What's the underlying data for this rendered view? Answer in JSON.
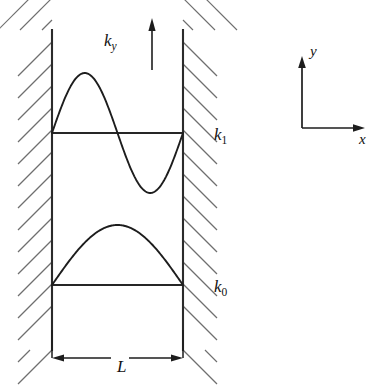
{
  "figure": {
    "background_color": "#ffffff",
    "ink_color": "#1d1d1d",
    "hatch_color": "#6f6f6f",
    "width": 391,
    "height": 385
  },
  "well": {
    "left_wall_x": 52,
    "right_wall_x": 183,
    "wall_top_y": 30,
    "wall_bottom_y": 350,
    "hatch_count": 15,
    "hatch_spacing": 22,
    "hatch_length": 34,
    "hatch_angle_deg": 45
  },
  "levels": [
    {
      "name": "k1",
      "label_base": "k",
      "label_sub": "1",
      "baseline_y": 133,
      "label_x": 214,
      "label_y": 140,
      "mode_number": 2,
      "amplitude": 60,
      "description": "full sine, one node at center"
    },
    {
      "name": "k0",
      "label_base": "k",
      "label_sub": "0",
      "baseline_y": 285,
      "label_x": 214,
      "label_y": 292,
      "mode_number": 1,
      "amplitude": 60,
      "description": "half sine, ground state arch"
    }
  ],
  "ky_annotation": {
    "label_base": "k",
    "label_sub": "y",
    "label_x": 104,
    "label_y": 46,
    "arrow_x": 152,
    "arrow_top_y": 18,
    "arrow_bottom_y": 70
  },
  "dimension": {
    "label": "L",
    "label_x": 117,
    "label_y": 372,
    "line_y": 358,
    "left_x": 52,
    "right_x": 183,
    "tick_top_y": 330
  },
  "axes": {
    "origin_x": 302,
    "origin_y": 128,
    "y_axis_top_y": 56,
    "x_axis_right_x": 365,
    "y_label": "y",
    "y_label_x": 310,
    "y_label_y": 56,
    "x_label": "x",
    "x_label_x": 359,
    "x_label_y": 144
  }
}
